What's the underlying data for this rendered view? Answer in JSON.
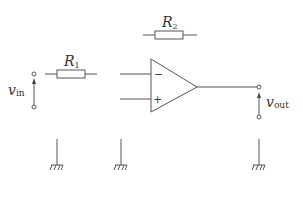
{
  "diagram": {
    "type": "circuit-schematic",
    "components": {
      "r1": {
        "symbol": "R",
        "subscript": "1"
      },
      "r2": {
        "symbol": "R",
        "subscript": "2"
      },
      "opamp": {
        "minus_label": "−",
        "plus_label": "+"
      }
    },
    "input": {
      "symbol": "v",
      "subscript": "in"
    },
    "output": {
      "symbol": "v",
      "subscript": "out"
    },
    "grounds": 3,
    "colors": {
      "stroke": "#555555",
      "background": "#ffffff"
    }
  }
}
